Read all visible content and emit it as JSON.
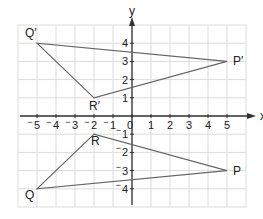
{
  "diagram": {
    "type": "coordinate-grid-reflection",
    "axes": {
      "x_label": "x",
      "y_label": "y",
      "x_range": [
        -6,
        6
      ],
      "y_range": [
        -5,
        5
      ],
      "x_ticks": [
        "-5",
        "-4",
        "-3",
        "-2",
        "-1",
        "0",
        "1",
        "2",
        "3",
        "4",
        "5"
      ],
      "y_ticks": [
        "4",
        "3",
        "2",
        "1",
        "-1",
        "-2",
        "-3",
        "-4"
      ]
    },
    "triangles": [
      {
        "name": "PQR",
        "vertices": [
          {
            "label": "P",
            "x": 5,
            "y": -3
          },
          {
            "label": "Q",
            "x": -5,
            "y": -4
          },
          {
            "label": "R",
            "x": -2,
            "y": -1
          }
        ]
      },
      {
        "name": "P'Q'R'",
        "vertices": [
          {
            "label": "P′",
            "x": 5,
            "y": 3
          },
          {
            "label": "Q′",
            "x": -5,
            "y": 4
          },
          {
            "label": "R′",
            "x": -2,
            "y": 1
          }
        ]
      }
    ],
    "colors": {
      "grid": "#dcdcdc",
      "axis": "#333333",
      "shape": "#666666",
      "text": "#222222"
    }
  }
}
